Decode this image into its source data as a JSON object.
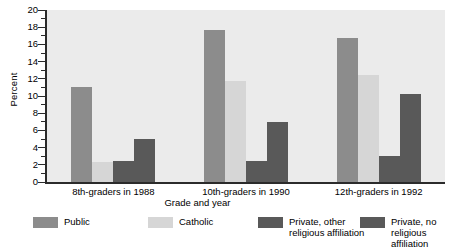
{
  "chart_data": {
    "type": "bar",
    "title": "",
    "xlabel": "Grade and year",
    "ylabel": "Percent",
    "ylim": [
      0,
      20
    ],
    "ytick_step": 2,
    "yminor_step": 1,
    "grid": false,
    "legend_position": "bottom",
    "categories": [
      "8th-graders in 1988",
      "10th-graders in 1990",
      "12th-graders in 1992"
    ],
    "series": [
      {
        "name": "Public",
        "color": "#8c8c8c",
        "values": [
          11.0,
          17.7,
          16.7
        ]
      },
      {
        "name": "Catholic",
        "color": "#d6d6d6",
        "values": [
          2.3,
          11.7,
          12.5
        ]
      },
      {
        "name": "Private, other\nreligious affiliation",
        "color": "#595959",
        "values": [
          2.5,
          2.5,
          3.0
        ]
      },
      {
        "name": "Private, no\nreligious affiliation",
        "color": "#595959",
        "values": [
          5.0,
          7.0,
          10.2
        ]
      }
    ]
  },
  "axes": {
    "y_title": "Percent",
    "x_title": "Grade and year",
    "y_ticks": [
      "20",
      "18",
      "16",
      "14",
      "12",
      "10",
      "8",
      "6",
      "4",
      "2",
      "0"
    ]
  },
  "legend": {
    "items": [
      {
        "label": "Public"
      },
      {
        "label": "Catholic"
      },
      {
        "label": "Private, other\nreligious affiliation"
      },
      {
        "label": "Private, no\nreligious affiliation"
      }
    ]
  }
}
